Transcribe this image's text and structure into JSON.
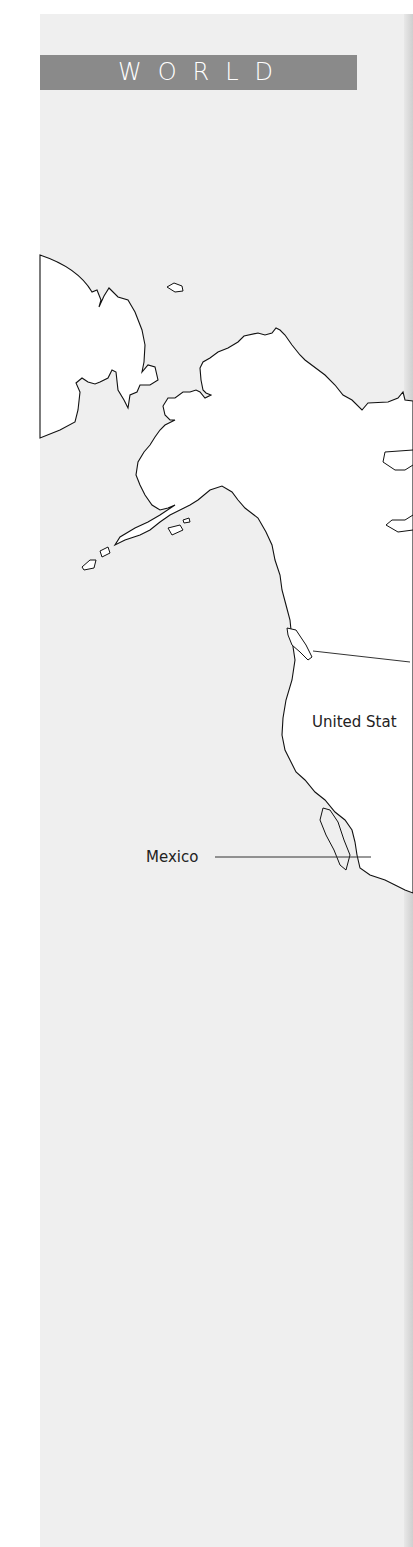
{
  "header": {
    "title": "WORLD"
  },
  "map": {
    "land_color": "#ffffff",
    "water_color": "#efefef",
    "outline_color": "#111111",
    "labels": [
      {
        "id": "united-states",
        "text": "United Stat"
      },
      {
        "id": "mexico",
        "text": "Mexico"
      }
    ]
  }
}
